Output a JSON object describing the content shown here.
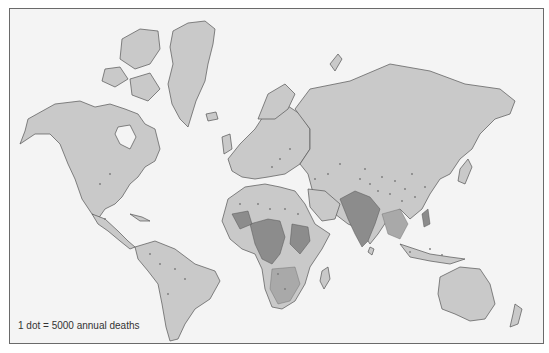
{
  "map": {
    "type": "dot-density world map",
    "legend": "1 dot = 5000 annual deaths",
    "colors": {
      "ocean": "#f4f4f4",
      "land": "#c9c9c9",
      "border": "#555555",
      "high_density": "#8c8c8c",
      "medium_density": "#a9a9a9",
      "dot": "#7a7a7a",
      "frame": "#6a6a6a"
    },
    "regions_high_density": [
      "India",
      "Pakistan",
      "Bangladesh",
      "Central Africa",
      "West Africa",
      "East Africa",
      "Philippines"
    ],
    "regions_medium_density": [
      "Sub-Saharan Africa",
      "Southeast Asia",
      "Indonesia",
      "China"
    ]
  }
}
